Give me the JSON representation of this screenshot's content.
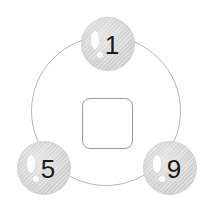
{
  "puzzle": {
    "center_slot": {
      "value": ""
    },
    "nodes": [
      {
        "position": "top",
        "label": "1"
      },
      {
        "position": "bottom-left",
        "label": "5"
      },
      {
        "position": "bottom-right",
        "label": "9"
      }
    ]
  },
  "colors": {
    "ring": "#b8b8b8",
    "bubble": "#d2d2d2",
    "digit": "#1a1a1a",
    "slot_border": "#9a9a9a"
  }
}
